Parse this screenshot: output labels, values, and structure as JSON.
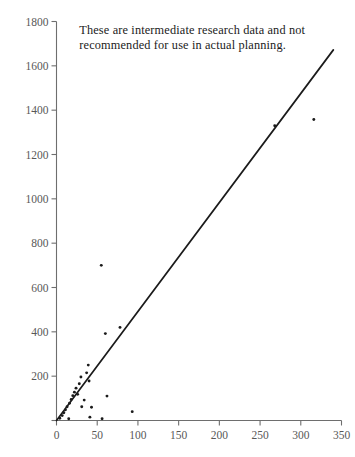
{
  "chart_data": {
    "type": "scatter",
    "title": "",
    "subtitle": "",
    "xlabel": "",
    "ylabel": "",
    "xlim": [
      0,
      350
    ],
    "ylim": [
      0,
      1800
    ],
    "grid": false,
    "legend": null,
    "x_ticks": [
      0,
      50,
      100,
      150,
      200,
      250,
      300,
      350
    ],
    "x_tick_labels": [
      "0",
      "50",
      "100",
      "150",
      "200",
      "250",
      "300",
      "350"
    ],
    "y_ticks": [
      0,
      200,
      400,
      600,
      800,
      1000,
      1200,
      1400,
      1600,
      1800
    ],
    "y_tick_labels": [
      "",
      "200",
      "400",
      "600",
      "800",
      "1000",
      "1200",
      "1400",
      "1600",
      "1800"
    ],
    "annotations": [
      {
        "name": "disclaimer",
        "line1": "These are intermediate research data and not",
        "line2": "recommended for use in actual planning.",
        "x": 28,
        "y": 1790
      }
    ],
    "series": [
      {
        "name": "observations",
        "type": "scatter",
        "marker": "dot",
        "color": "#1b1b1b",
        "points": [
          [
            4,
            10
          ],
          [
            7,
            22
          ],
          [
            9,
            35
          ],
          [
            11,
            48
          ],
          [
            13,
            62
          ],
          [
            15,
            8
          ],
          [
            16,
            78
          ],
          [
            18,
            95
          ],
          [
            20,
            112
          ],
          [
            22,
            128
          ],
          [
            24,
            146
          ],
          [
            26,
            118
          ],
          [
            28,
            166
          ],
          [
            30,
            196
          ],
          [
            31,
            62
          ],
          [
            34,
            92
          ],
          [
            37,
            215
          ],
          [
            39,
            250
          ],
          [
            40,
            178
          ],
          [
            41,
            15
          ],
          [
            43,
            60
          ],
          [
            55,
            700
          ],
          [
            56,
            8
          ],
          [
            60,
            392
          ],
          [
            62,
            110
          ],
          [
            78,
            420
          ],
          [
            93,
            40
          ],
          [
            268,
            1330
          ],
          [
            316,
            1358
          ]
        ]
      },
      {
        "name": "regression-line",
        "type": "line",
        "color": "#1b1b1b",
        "x_start": 0,
        "y_start": 0,
        "x_end": 340,
        "y_end": 1672,
        "slope": 4.92,
        "intercept": 0
      }
    ]
  }
}
